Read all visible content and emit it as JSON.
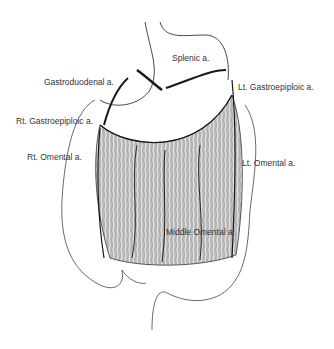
{
  "diagram": {
    "labels": [
      {
        "id": "splenic",
        "text": "Splenic a.",
        "x": 172,
        "y": 53
      },
      {
        "id": "gastroduodenal",
        "text": "Gastroduodenal a.",
        "x": 44,
        "y": 77
      },
      {
        "id": "lt-gastroepiploic",
        "text": "Lt. Gastroepiploic a.",
        "x": 238,
        "y": 82
      },
      {
        "id": "rt-gastroepiploic",
        "text": "Rt. Gastroepiploic a.",
        "x": 16,
        "y": 116
      },
      {
        "id": "rt-omental",
        "text": "Rt. Omental a.",
        "x": 27,
        "y": 152
      },
      {
        "id": "lt-omental",
        "text": "Lt. Omental a.",
        "x": 242,
        "y": 158
      },
      {
        "id": "middle-omental",
        "text": "Middle Omental a.",
        "x": 166,
        "y": 227
      }
    ],
    "colors": {
      "line": "#222222",
      "omentum": "#a9a9a9",
      "label": "#333333"
    }
  }
}
